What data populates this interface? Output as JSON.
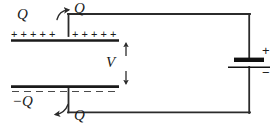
{
  "figure": {
    "type": "circuit-diagram",
    "colors": {
      "wire": "#2b2b2b",
      "plate": "#1a1a1a",
      "dashed": "#555555",
      "text": "#1a1a1a",
      "background": "#ffffff"
    }
  },
  "labels": {
    "charge_top_left": "Q",
    "charge_top_wire": "Q",
    "charge_bottom_plate": "−Q",
    "charge_bottom_wire": "Q",
    "voltage": "V",
    "battery_positive": "+",
    "battery_negative": "−"
  },
  "plates": {
    "top": {
      "polarity": "positive",
      "charge_symbols_left": "+  +  +  +  +",
      "charge_symbols_right": "+  +  +  +  +",
      "count_left": 5,
      "count_right": 5
    },
    "bottom": {
      "polarity": "negative",
      "charge_label": "−Q"
    }
  },
  "battery": {
    "positive_label": "+",
    "negative_label": "−",
    "orientation": "vertical",
    "long_plate": "positive",
    "short_plate": "negative"
  },
  "arrows": {
    "voltage_up": "up-arrow",
    "voltage_down": "down-arrow",
    "current_top": "curved-arrow-up",
    "current_bottom": "curved-arrow-left"
  }
}
